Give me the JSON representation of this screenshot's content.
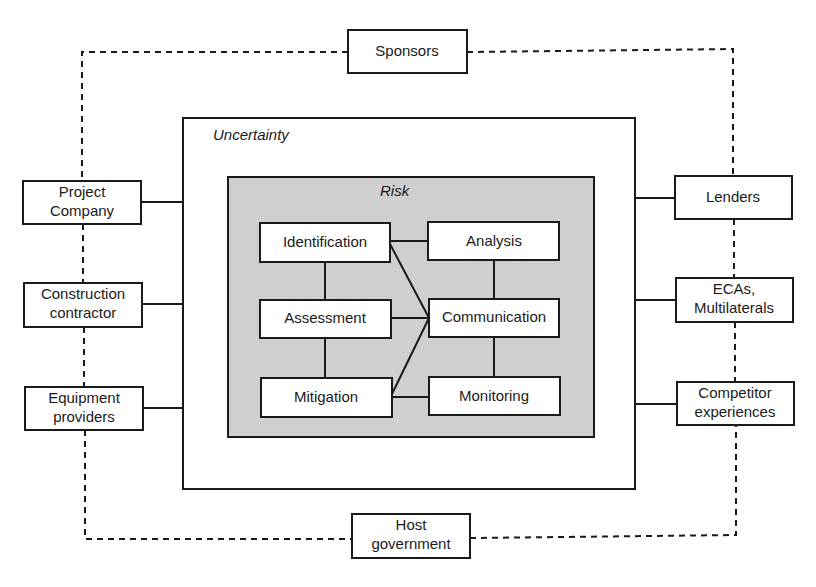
{
  "diagram": {
    "outer_regions": {
      "uncertainty": {
        "label": "Uncertainty"
      },
      "risk": {
        "label": "Risk"
      }
    },
    "stakeholders": {
      "sponsors": {
        "lines": [
          "Sponsors"
        ]
      },
      "project_company": {
        "lines": [
          "Project",
          "Company"
        ]
      },
      "construction_contractor": {
        "lines": [
          "Construction",
          "contractor"
        ]
      },
      "equipment_providers": {
        "lines": [
          "Equipment",
          "providers"
        ]
      },
      "lenders": {
        "lines": [
          "Lenders"
        ]
      },
      "ecas_multilaterals": {
        "lines": [
          "ECAs,",
          "Multilaterals"
        ]
      },
      "competitor_experiences": {
        "lines": [
          "Competitor",
          "experiences"
        ]
      },
      "host_government": {
        "lines": [
          "Host",
          "government"
        ]
      }
    },
    "risk_process": {
      "identification": "Identification",
      "assessment": "Assessment",
      "mitigation": "Mitigation",
      "analysis": "Analysis",
      "communication": "Communication",
      "monitoring": "Monitoring"
    },
    "colors": {
      "risk_fill": "#cfcfcf",
      "line": "#1a1a1a",
      "background": "#ffffff"
    }
  }
}
